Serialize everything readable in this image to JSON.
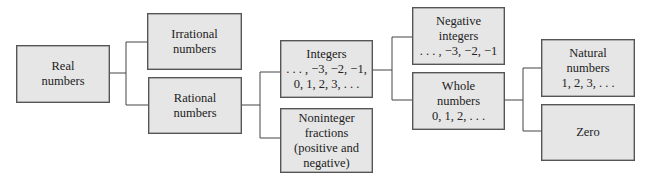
{
  "diagram": {
    "type": "classification-tree",
    "colors": {
      "box_fill": "#e6e6e6",
      "box_border": "#555555",
      "connector": "#444444"
    },
    "nodes": {
      "real": {
        "lines": [
          "Real",
          "numbers"
        ]
      },
      "irrational": {
        "lines": [
          "Irrational",
          "numbers"
        ]
      },
      "rational": {
        "lines": [
          "Rational",
          "numbers"
        ]
      },
      "integers": {
        "lines": [
          "Integers",
          ". . . , −3, −2, −1,",
          "0, 1, 2, 3, . . ."
        ]
      },
      "noninteger": {
        "lines": [
          "Noninteger",
          "fractions",
          "(positive and",
          "negative)"
        ]
      },
      "negative": {
        "lines": [
          "Negative",
          "integers",
          ". . . , −3, −2, −1"
        ]
      },
      "whole": {
        "lines": [
          "Whole",
          "numbers",
          "0, 1, 2, . . ."
        ]
      },
      "natural": {
        "lines": [
          "Natural",
          "numbers",
          "1, 2, 3, . . ."
        ]
      },
      "zero": {
        "lines": [
          "Zero"
        ]
      }
    },
    "edges": [
      [
        "real",
        "irrational"
      ],
      [
        "real",
        "rational"
      ],
      [
        "rational",
        "integers"
      ],
      [
        "rational",
        "noninteger"
      ],
      [
        "integers",
        "negative"
      ],
      [
        "integers",
        "whole"
      ],
      [
        "whole",
        "natural"
      ],
      [
        "whole",
        "zero"
      ]
    ]
  }
}
